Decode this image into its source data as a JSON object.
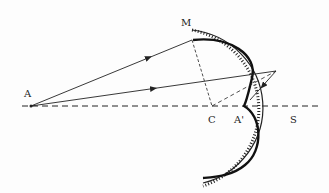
{
  "diagram": {
    "title": "",
    "labels": {
      "A": "A",
      "M": "M",
      "C": "C",
      "A_prime": "A'",
      "S": "S"
    },
    "points": {
      "A": [
        31,
        106
      ],
      "M": [
        192,
        40
      ],
      "C": [
        212,
        106
      ],
      "A_prime": [
        244,
        106
      ],
      "S": [
        290,
        106
      ],
      "reflection_point": [
        276,
        71
      ]
    },
    "elements": [
      "optical axis (dashed)",
      "concave spherical mirror with hatching",
      "caustic curve with cusp at A'",
      "incident rays from A with arrows",
      "reflected ray with arrow",
      "normals to C (dashed)"
    ],
    "colors": {
      "line": "#222222",
      "background": "#fdfdfd"
    }
  }
}
